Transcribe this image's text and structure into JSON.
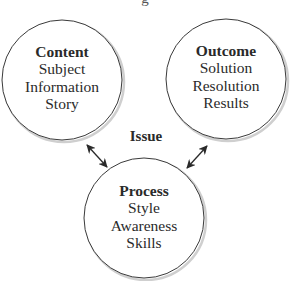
{
  "title_fragment": "g",
  "center_label": "Issue",
  "nodes": [
    {
      "title": "Content",
      "lines": [
        "Subject",
        "Information",
        "Story"
      ]
    },
    {
      "title": "Outcome",
      "lines": [
        "Solution",
        "Resolution",
        "Results"
      ]
    },
    {
      "title": "Process",
      "lines": [
        "Style",
        "Awareness",
        "Skills"
      ]
    }
  ],
  "connectors": [
    {
      "from": "Content",
      "to": "Process",
      "type": "bidirectional-arrow"
    },
    {
      "from": "Outcome",
      "to": "Process",
      "type": "bidirectional-arrow"
    }
  ],
  "colors": {
    "stroke": "#3a3a3a",
    "shadow": "#c8c8c8",
    "text": "#2a2a2a",
    "background": "#ffffff"
  }
}
